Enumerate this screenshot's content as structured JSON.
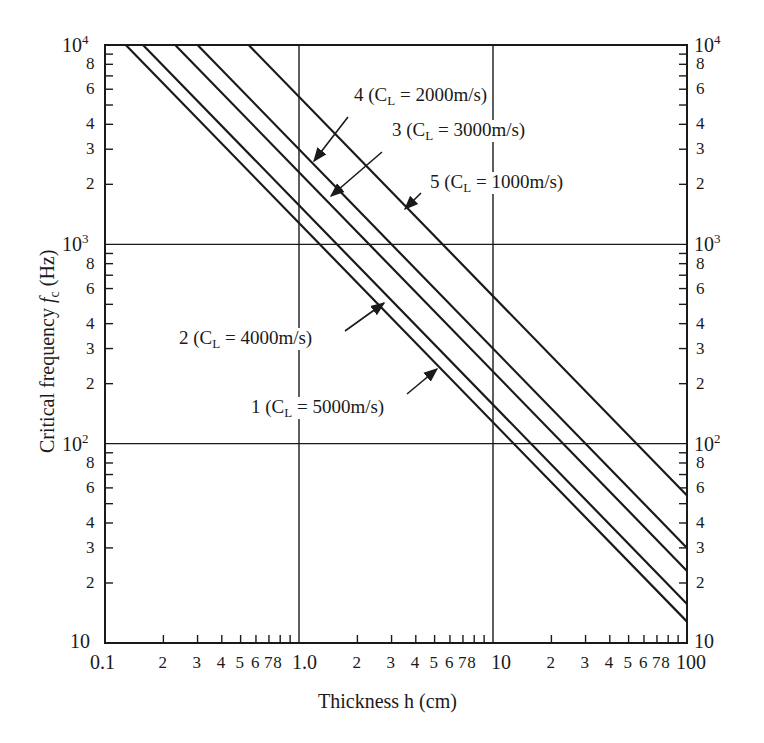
{
  "chart_data": {
    "type": "line",
    "title": "",
    "xlabel": "Thickness h (cm)",
    "ylabel": "Critical frequency f_c (Hz)",
    "ylabel_parts": {
      "pre": "Critical frequency ",
      "italic": "f",
      "sub": "c",
      "post": " (Hz)"
    },
    "xscale": "log",
    "yscale": "log",
    "xlim": [
      0.1,
      100
    ],
    "ylim": [
      10,
      10000
    ],
    "grid": {
      "x_major": [
        1.0,
        10
      ],
      "y_major": [
        100,
        1000
      ]
    },
    "x_tick_labels": {
      "major": [
        {
          "v": 0.1,
          "t": "0.1"
        },
        {
          "v": 1.0,
          "t": "1.0"
        },
        {
          "v": 10,
          "t": "10"
        },
        {
          "v": 100,
          "t": "100"
        }
      ],
      "minor": [
        "2",
        "3",
        "4",
        "5",
        "6",
        "7",
        "8"
      ]
    },
    "y_tick_labels": {
      "major": [
        {
          "v": 10,
          "base": "10",
          "exp": ""
        },
        {
          "v": 100,
          "base": "10",
          "exp": "2"
        },
        {
          "v": 1000,
          "base": "10",
          "exp": "3"
        },
        {
          "v": 10000,
          "base": "10",
          "exp": "4"
        }
      ],
      "minor_labeled": [
        "2",
        "3",
        "4",
        "6",
        "8"
      ]
    },
    "legend_position": "inline annotations with arrows",
    "series": [
      {
        "id": 1,
        "name": "1 (C_L = 5000m/s)",
        "num": "1",
        "cl": "5000m/s",
        "fc_times_h": 1280,
        "x": [
          0.128,
          1,
          10,
          100
        ],
        "y": [
          10000,
          1280,
          128,
          12.8
        ]
      },
      {
        "id": 2,
        "name": "2 (C_L = 4000m/s)",
        "num": "2",
        "cl": "4000m/s",
        "fc_times_h": 1570,
        "x": [
          0.157,
          1,
          10,
          100
        ],
        "y": [
          10000,
          1570,
          157,
          15.7
        ]
      },
      {
        "id": 3,
        "name": "3 (C_L = 3000m/s)",
        "num": "3",
        "cl": "3000m/s",
        "fc_times_h": 2300,
        "x": [
          0.23,
          1,
          10,
          100
        ],
        "y": [
          10000,
          2300,
          230,
          23
        ]
      },
      {
        "id": 4,
        "name": "4 (C_L = 2000m/s)",
        "num": "4",
        "cl": "2000m/s",
        "fc_times_h": 3000,
        "x": [
          0.3,
          1,
          10,
          100
        ],
        "y": [
          10000,
          3000,
          300,
          30
        ]
      },
      {
        "id": 5,
        "name": "5 (C_L = 1000m/s)",
        "num": "5",
        "cl": "1000m/s",
        "fc_times_h": 5500,
        "x": [
          0.55,
          1,
          10,
          100
        ],
        "y": [
          10000,
          5500,
          550,
          55
        ]
      }
    ],
    "annotations": [
      {
        "series": 4,
        "text_x": 352,
        "text_y": 85,
        "arrow_from": [
          348,
          117
        ],
        "arrow_to": [
          314,
          161
        ]
      },
      {
        "series": 3,
        "text_x": 390,
        "text_y": 120,
        "arrow_from": [
          382,
          152
        ],
        "arrow_to": [
          331,
          196
        ]
      },
      {
        "series": 5,
        "text_x": 428,
        "text_y": 172,
        "arrow_from": [
          421,
          193
        ],
        "arrow_to": [
          405,
          209
        ]
      },
      {
        "series": 2,
        "text_x": 177,
        "text_y": 328,
        "arrow_from": [
          345,
          331
        ],
        "arrow_to": [
          384,
          303
        ]
      },
      {
        "series": 1,
        "text_x": 249,
        "text_y": 397,
        "arrow_from": [
          407,
          394
        ],
        "arrow_to": [
          437,
          369
        ]
      }
    ]
  },
  "colors": {
    "ink": "#1a1a1a",
    "background": "#ffffff"
  }
}
